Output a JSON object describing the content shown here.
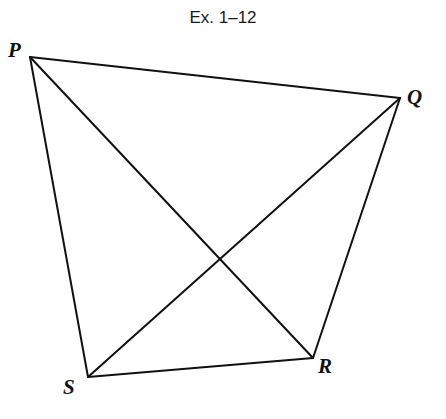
{
  "figure": {
    "caption": "Ex. 1–12",
    "line_color": "#111111",
    "vertices": [
      {
        "label": "P",
        "x": 30,
        "y": 57
      },
      {
        "label": "Q",
        "x": 400,
        "y": 98
      },
      {
        "label": "R",
        "x": 313,
        "y": 358
      },
      {
        "label": "S",
        "x": 88,
        "y": 377
      }
    ],
    "segments": [
      [
        "P",
        "Q"
      ],
      [
        "Q",
        "R"
      ],
      [
        "R",
        "S"
      ],
      [
        "S",
        "P"
      ],
      [
        "P",
        "R"
      ],
      [
        "Q",
        "S"
      ]
    ],
    "labels": {
      "P": "P",
      "Q": "Q",
      "R": "R",
      "S": "S"
    }
  }
}
